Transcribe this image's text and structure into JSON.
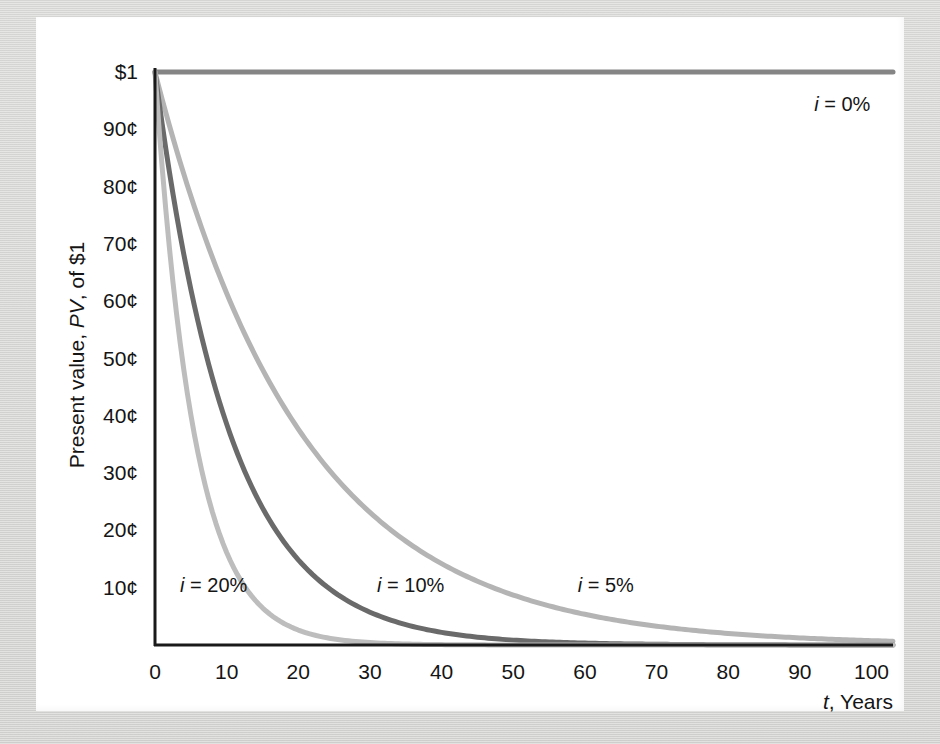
{
  "figure": {
    "background_color": "#d6d6d4",
    "card_color": "#ffffff",
    "axis_color": "#1a1a1a"
  },
  "axis_titles": {
    "y_axis": "Present value, PV, of $1",
    "y_axis_plain": "Present value,",
    "y_axis_italic": "PV",
    "y_axis_tail": ", of $1",
    "x_axis": "t, Years",
    "x_axis_italic": "t",
    "x_axis_tail": ", Years"
  },
  "chart_data": {
    "type": "line",
    "title": "",
    "xlabel": "t, Years",
    "ylabel": "Present value, PV, of $1",
    "xlim": [
      0,
      103
    ],
    "ylim": [
      0,
      1.0
    ],
    "grid": false,
    "legend": "inline-curve-labels",
    "x_ticks": [
      0,
      10,
      20,
      30,
      40,
      50,
      60,
      70,
      80,
      90,
      100
    ],
    "x_tick_labels": [
      "0",
      "10",
      "20",
      "30",
      "40",
      "50",
      "60",
      "70",
      "80",
      "90",
      "100"
    ],
    "y_ticks": [
      1.0,
      0.9,
      0.8,
      0.7,
      0.6,
      0.5,
      0.4,
      0.3,
      0.2,
      0.1
    ],
    "y_tick_labels": [
      "$1",
      "90¢",
      "80¢",
      "70¢",
      "60¢",
      "50¢",
      "40¢",
      "30¢",
      "20¢",
      "10¢"
    ],
    "x": [
      0,
      5,
      10,
      15,
      20,
      25,
      30,
      35,
      40,
      45,
      50,
      55,
      60,
      65,
      70,
      75,
      80,
      85,
      90,
      95,
      100
    ],
    "series": [
      {
        "name": "i = 0%",
        "rate": 0.0,
        "color": "#858585",
        "label": "i = 0%",
        "label_italic": "i",
        "label_tail": " = 0%",
        "label_x": 92,
        "label_y": 0.945,
        "values": [
          1.0,
          1.0,
          1.0,
          1.0,
          1.0,
          1.0,
          1.0,
          1.0,
          1.0,
          1.0,
          1.0,
          1.0,
          1.0,
          1.0,
          1.0,
          1.0,
          1.0,
          1.0,
          1.0,
          1.0,
          1.0
        ]
      },
      {
        "name": "i = 5%",
        "rate": 0.05,
        "color": "#b4b4b4",
        "label": "i = 5%",
        "label_italic": "i",
        "label_tail": " = 5%",
        "label_x": 59,
        "label_y": 0.105,
        "values": [
          1.0,
          0.784,
          0.614,
          0.481,
          0.377,
          0.295,
          0.231,
          0.181,
          0.142,
          0.111,
          0.087,
          0.068,
          0.054,
          0.042,
          0.033,
          0.026,
          0.02,
          0.016,
          0.012,
          0.01,
          0.008
        ]
      },
      {
        "name": "i = 10%",
        "rate": 0.1,
        "color": "#6a6a6a",
        "label": "i = 10%",
        "label_italic": "i",
        "label_tail": " = 10%",
        "label_x": 31,
        "label_y": 0.105,
        "values": [
          1.0,
          0.621,
          0.386,
          0.239,
          0.149,
          0.092,
          0.057,
          0.036,
          0.022,
          0.014,
          0.0085,
          0.0053,
          0.0033,
          0.002,
          0.0013,
          0.0008,
          0.0005,
          0.0003,
          0.0002,
          0.0001,
          0.0001
        ]
      },
      {
        "name": "i = 20%",
        "rate": 0.2,
        "color": "#bdbdbd",
        "label": "i = 20%",
        "label_italic": "i",
        "label_tail": " = 20%",
        "label_x": 3.5,
        "label_y": 0.105,
        "values": [
          1.0,
          0.402,
          0.162,
          0.065,
          0.026,
          0.0105,
          0.0042,
          0.0017,
          0.0007,
          0.0003,
          0.0001,
          0.0,
          0.0,
          0.0,
          0.0,
          0.0,
          0.0,
          0.0,
          0.0,
          0.0,
          0.0
        ]
      }
    ]
  }
}
